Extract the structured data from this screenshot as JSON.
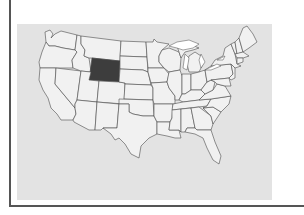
{
  "map": {
    "title": "",
    "region": "United States",
    "highlighted_state": "Wyoming",
    "colors": {
      "background": "#e3e3e3",
      "state_fill": "#f1f1f1",
      "state_border": "#4a4a4a",
      "highlight_fill": "#3d3d3d",
      "frame": "#555555"
    }
  }
}
